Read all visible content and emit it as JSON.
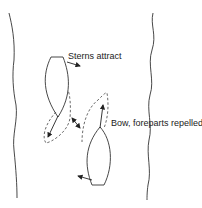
{
  "diagram": {
    "type": "boat-interaction",
    "labels": {
      "sterns": "Sterns attract",
      "bow": "Bow, foreparts repelled"
    },
    "elements": [
      "left-bank",
      "right-bank",
      "upper-boat",
      "lower-boat",
      "upper-boat-wake",
      "lower-boat-bow-wave"
    ],
    "colors": {
      "line": "#333333",
      "background": "#ffffff"
    }
  }
}
